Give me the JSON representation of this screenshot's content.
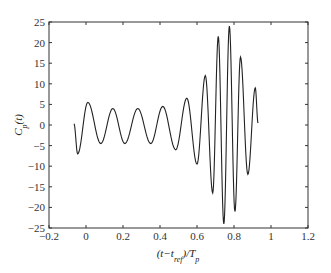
{
  "chart_data": {
    "type": "line",
    "title": "",
    "xlabel": "(t−t_ref)/T_p",
    "ylabel": "C_p(t)",
    "xlim": [
      -0.2,
      1.2
    ],
    "ylim": [
      -25,
      25
    ],
    "xticks": [
      -0.2,
      0,
      0.2,
      0.4,
      0.6,
      0.8,
      1,
      1.2
    ],
    "xtick_labels": [
      "−0.2",
      "0",
      "0.2",
      "0.4",
      "0.6",
      "0.8",
      "1",
      "1.2"
    ],
    "yticks": [
      -25,
      -20,
      -15,
      -10,
      -5,
      0,
      5,
      10,
      15,
      20,
      25
    ],
    "ytick_labels": [
      "−25",
      "−20",
      "−15",
      "−10",
      "−5",
      "0",
      "5",
      "10",
      "15",
      "20",
      "25"
    ],
    "grid": false,
    "legend": null,
    "line_color": "#222222",
    "series": [
      {
        "name": "C_p(t)",
        "x": [
          -0.065,
          -0.045,
          0.01,
          0.08,
          0.145,
          0.21,
          0.28,
          0.35,
          0.415,
          0.485,
          0.545,
          0.6,
          0.645,
          0.685,
          0.715,
          0.745,
          0.775,
          0.805,
          0.835,
          0.875,
          0.915,
          0.93
        ],
        "values": [
          0.3,
          -7,
          5.5,
          -4.5,
          4,
          -4.5,
          4,
          -4.5,
          4.5,
          -6,
          6.5,
          -9.5,
          12,
          -16.5,
          21.5,
          -24,
          24,
          -21,
          16.5,
          -12,
          9,
          0.5
        ]
      }
    ]
  }
}
